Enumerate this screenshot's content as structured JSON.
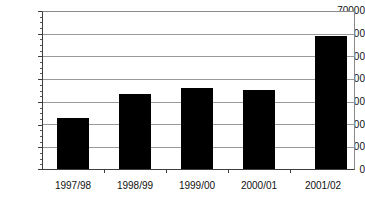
{
  "chart_data": {
    "type": "bar",
    "title": "",
    "subtitle": "",
    "xlabel": "",
    "ylabel": "",
    "categories": [
      "1997/98",
      "1998/99",
      "1999/00",
      "2000/01",
      "2001/02"
    ],
    "values": [
      23000,
      34000,
      36500,
      35800,
      60000
    ],
    "series": [
      {
        "name": "",
        "values": [
          23000,
          34000,
          36500,
          35800,
          60000
        ]
      }
    ],
    "ylim": [
      0,
      70000
    ],
    "y_ticks": [
      0,
      10000,
      20000,
      30000,
      40000,
      50000,
      60000,
      70000
    ],
    "y_tick_labels": [
      "0",
      "10000",
      "20000",
      "30000",
      "40000",
      "50000",
      "60000",
      "70000"
    ],
    "grid": true,
    "grid_axis": "y",
    "legend": false,
    "legend_position": "none",
    "bar_color": "#000000",
    "plot_background": "#ffffff",
    "grid_color": "#9a9a9a",
    "axis_color": "#3d3d3d"
  },
  "axes": {
    "y_labels": [
      "70000",
      "60000",
      "50000",
      "40000",
      "30000",
      "20000",
      "10000",
      "0"
    ],
    "x_labels": [
      "1997/98",
      "1998/99",
      "1999/00",
      "2000/01",
      "2001/02"
    ]
  }
}
